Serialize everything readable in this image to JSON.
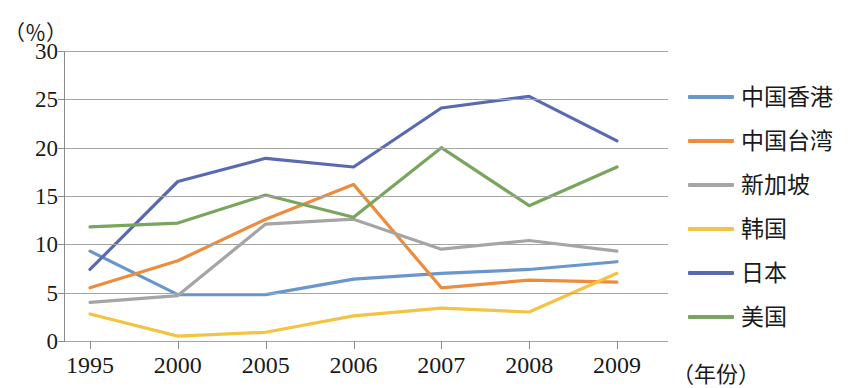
{
  "chart_data": {
    "type": "line",
    "title": "",
    "subtitle": "",
    "ylabel": "（％）",
    "xlabel": "（年份）",
    "ylim": [
      0,
      30
    ],
    "yticks": [
      0,
      5,
      10,
      15,
      20,
      25,
      30
    ],
    "ytick_labels": [
      "0",
      "5",
      "10",
      "15",
      "20",
      "25",
      "30"
    ],
    "grid": true,
    "legend_position": "right",
    "categories": [
      "1995",
      "2000",
      "2005",
      "2006",
      "2007",
      "2008",
      "2009"
    ],
    "x": [
      "1995",
      "2000",
      "2005",
      "2006",
      "2007",
      "2008",
      "2009"
    ],
    "series": [
      {
        "name": "中国香港",
        "color": "#6a96ce",
        "values": [
          9.3,
          4.8,
          4.8,
          6.4,
          7.0,
          7.4,
          8.2
        ]
      },
      {
        "name": "中国台湾",
        "color": "#ed8c3c",
        "values": [
          5.5,
          8.3,
          12.6,
          16.2,
          5.5,
          6.3,
          6.1
        ]
      },
      {
        "name": "新加坡",
        "color": "#a5a5a5",
        "values": [
          4.0,
          4.7,
          12.1,
          12.6,
          9.5,
          10.4,
          9.3
        ]
      },
      {
        "name": "韩国",
        "color": "#f5c342",
        "values": [
          2.8,
          0.5,
          0.9,
          2.6,
          3.4,
          3.0,
          7.0
        ]
      },
      {
        "name": "日本",
        "color": "#5b6ab0",
        "values": [
          7.4,
          16.5,
          18.9,
          18.0,
          24.1,
          25.3,
          20.7
        ]
      },
      {
        "name": "美国",
        "color": "#79a65c",
        "values": [
          11.8,
          12.2,
          15.1,
          12.8,
          20.0,
          14.0,
          18.0
        ]
      }
    ]
  },
  "axes": {
    "y_unit_label": "（％）",
    "x_axis_title": "（年份）"
  }
}
